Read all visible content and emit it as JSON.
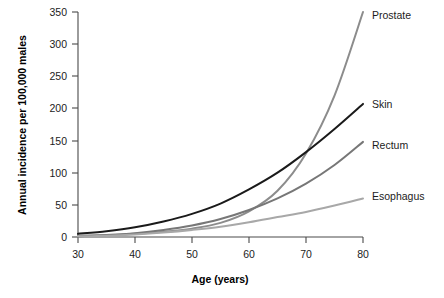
{
  "chart_data": {
    "type": "line",
    "title": "",
    "xlabel": "Age (years)",
    "ylabel": "Annual incidence per 100,000 males",
    "xlim": [
      30,
      80
    ],
    "ylim": [
      0,
      350
    ],
    "xticks": [
      "30",
      "40",
      "50",
      "60",
      "70",
      "80"
    ],
    "yticks": [
      "0",
      "50",
      "100",
      "150",
      "200",
      "250",
      "300",
      "350"
    ],
    "grid": false,
    "legend_position": "right-inline-labels",
    "x": [
      30,
      35,
      40,
      45,
      50,
      55,
      60,
      65,
      70,
      75,
      80
    ],
    "series": [
      {
        "name": "Prostate",
        "color": "#8c8c8c",
        "values": [
          2,
          3,
          5,
          8,
          13,
          22,
          40,
          72,
          130,
          220,
          350
        ]
      },
      {
        "name": "Skin",
        "color": "#1a1a1a",
        "values": [
          5,
          9,
          15,
          24,
          36,
          52,
          74,
          100,
          132,
          168,
          207
        ]
      },
      {
        "name": "Rectum",
        "color": "#777777",
        "values": [
          1,
          3,
          6,
          11,
          18,
          28,
          42,
          60,
          83,
          112,
          148
        ]
      },
      {
        "name": "Esophagus",
        "color": "#a8a8a8",
        "values": [
          1,
          2,
          4,
          7,
          11,
          16,
          23,
          31,
          39,
          49,
          60
        ]
      }
    ]
  },
  "axes": {
    "x_title": "Age (years)",
    "y_title": "Annual incidence per 100,000 males"
  },
  "labels": {
    "prostate": "Prostate",
    "skin": "Skin",
    "rectum": "Rectum",
    "esophagus": "Esophagus"
  },
  "yticks": {
    "t0": "0",
    "t1": "50",
    "t2": "100",
    "t3": "150",
    "t4": "200",
    "t5": "250",
    "t6": "300",
    "t7": "350"
  },
  "xticks": {
    "t0": "30",
    "t1": "40",
    "t2": "50",
    "t3": "60",
    "t4": "70",
    "t5": "80"
  }
}
